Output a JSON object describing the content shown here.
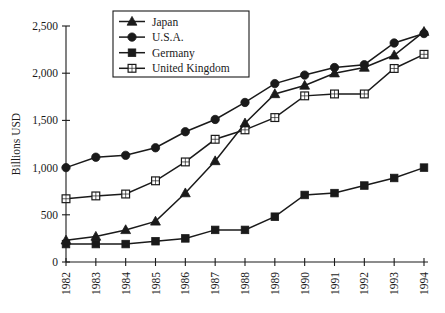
{
  "chart_data": {
    "type": "line",
    "title": "",
    "subtitle": "",
    "xlabel": "",
    "ylabel": "Billions USD",
    "categories": [
      "1982",
      "1983",
      "1984",
      "1985",
      "1986",
      "1987",
      "1988",
      "1989",
      "1990",
      "1991",
      "1992",
      "1993",
      "1994"
    ],
    "x": [
      1982,
      1983,
      1984,
      1985,
      1986,
      1987,
      1988,
      1989,
      1990,
      1991,
      1992,
      1993,
      1994
    ],
    "ylim": [
      0,
      2500
    ],
    "yticks": [
      0,
      500,
      1000,
      1500,
      2000,
      2500
    ],
    "ytick_labels": [
      "0",
      "500",
      "1,000",
      "1,500",
      "2,000",
      "2,500"
    ],
    "grid": false,
    "legend_position": "top-center",
    "xtick_rotation": 90,
    "series": [
      {
        "name": "Japan",
        "marker": "filled-triangle",
        "color": "#1a1a1a",
        "values": [
          230,
          270,
          340,
          430,
          730,
          1070,
          1470,
          1780,
          1870,
          2000,
          2060,
          2190,
          2440
        ]
      },
      {
        "name": "U.S.A.",
        "marker": "filled-circle",
        "color": "#1a1a1a",
        "values": [
          1000,
          1110,
          1130,
          1210,
          1380,
          1510,
          1690,
          1890,
          1980,
          2060,
          2090,
          2320,
          2420
        ]
      },
      {
        "name": "Germany",
        "marker": "filled-square",
        "color": "#1a1a1a",
        "values": [
          190,
          190,
          190,
          220,
          250,
          340,
          340,
          480,
          710,
          730,
          810,
          890,
          1000
        ]
      },
      {
        "name": "United Kingdom",
        "marker": "open-square",
        "color": "#1a1a1a",
        "values": [
          670,
          700,
          720,
          860,
          1060,
          1300,
          1400,
          1530,
          1760,
          1780,
          1780,
          2050,
          2200
        ]
      }
    ]
  },
  "legend": {
    "items": [
      {
        "label": "Japan",
        "marker": "filled-triangle"
      },
      {
        "label": "U.S.A.",
        "marker": "filled-circle"
      },
      {
        "label": "Germany",
        "marker": "filled-square"
      },
      {
        "label": "United Kingdom",
        "marker": "open-square"
      }
    ]
  },
  "axes": {
    "y_axis_title": "Billions USD",
    "y_tick_labels": [
      "2,500",
      "2,000",
      "1,500",
      "1,000",
      "500",
      "0"
    ],
    "x_tick_labels": [
      "1982",
      "1983",
      "1984",
      "1985",
      "1986",
      "1987",
      "1988",
      "1989",
      "1990",
      "1991",
      "1992",
      "1993",
      "1994"
    ]
  }
}
